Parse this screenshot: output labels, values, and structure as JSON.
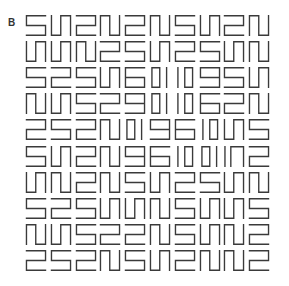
{
  "panel": {
    "label": "B"
  },
  "style": {
    "stroke_color": "#3a3a3a",
    "background": "#ffffff"
  },
  "grid": {
    "rows": 10,
    "cols": 10,
    "glyphs": {
      "S": "M21,1.5 H1.5 V11.5 H21 V21.5 H1.5",
      "Z": "M1.5,1.5 H21 V11.5 H1.5 V21.5 H21",
      "U": "M1.5,1.5 V21.5 H11 V1.5 H21 V21.5",
      "P": "M1.5,21.5 V1.5 H11 V21.5 H21 V1.5",
      "SIX": "M21,1.5 H1.5 V21.5 H21 V11.5 H1.5",
      "NINE": "M1.5,21.5 H21 V1.5 H1.5 V11.5 H21",
      "OBAR": "M3,1.5 H11 V21.5 H3 Z M18,1.5 V21.5",
      "BARO": "M4,1.5 V21.5 M11,1.5 H19 V21.5 H11 Z",
      "IP": "M2,1.5 V21.5 M8,21.5 V1.5 H21 V21.5"
    },
    "cells": [
      [
        "S",
        "U",
        "Z",
        "P",
        "Z",
        "P",
        "S",
        "U",
        "Z",
        "P"
      ],
      [
        "U",
        "U",
        "P",
        "Z",
        "S",
        "U",
        "Z",
        "S",
        "U",
        "P"
      ],
      [
        "S",
        "Z",
        "S",
        "U",
        "SIX",
        "OBAR",
        "BARO",
        "NINE",
        "S",
        "U"
      ],
      [
        "P",
        "U",
        "S",
        "Z",
        "NINE",
        "OBAR",
        "BARO",
        "SIX",
        "Z",
        "P"
      ],
      [
        "Z",
        "S",
        "Z",
        "P",
        "OBAR",
        "NINE",
        "SIX",
        "BARO",
        "U",
        "S"
      ],
      [
        "S",
        "U",
        "Z",
        "P",
        "NINE",
        "SIX",
        "BARO",
        "OBAR",
        "IP",
        "Z"
      ],
      [
        "U",
        "P",
        "Z",
        "P",
        "S",
        "U",
        "Z",
        "S",
        "U",
        "P"
      ],
      [
        "S",
        "Z",
        "S",
        "U",
        "U",
        "P",
        "S",
        "U",
        "U",
        "S"
      ],
      [
        "P",
        "U",
        "S",
        "Z",
        "Z",
        "P",
        "S",
        "U",
        "P",
        "Z"
      ],
      [
        "Z",
        "S",
        "Z",
        "P",
        "S",
        "U",
        "Z",
        "P",
        "P",
        "Z"
      ]
    ]
  }
}
